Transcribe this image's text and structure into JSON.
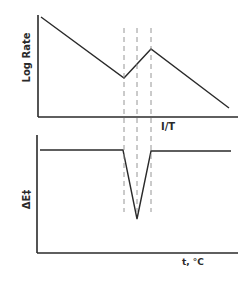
{
  "figure": {
    "top_plot": {
      "ylabel": "Log Rate",
      "xlabel": "I/T",
      "curve_points": [
        [
          41,
          17
        ],
        [
          124,
          78
        ],
        [
          151,
          49
        ],
        [
          229,
          108
        ]
      ]
    },
    "bottom_plot": {
      "ylabel": "ΔE‡",
      "xlabel": "t, °C",
      "curve_points": [
        [
          40,
          150
        ],
        [
          123,
          150
        ],
        [
          137,
          219
        ],
        [
          151,
          151
        ],
        [
          231,
          151
        ]
      ]
    },
    "transition_markers_x": [
      124,
      137,
      151
    ],
    "colors": {
      "ink": "#2a2a2a",
      "dash": "#8a8a8a",
      "background": "#ffffff"
    }
  }
}
